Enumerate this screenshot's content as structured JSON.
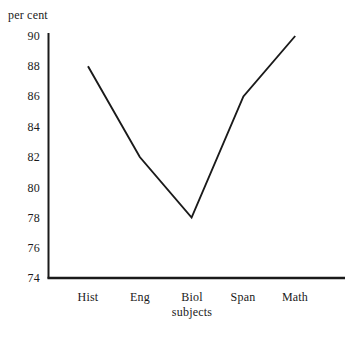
{
  "chart_data": {
    "type": "line",
    "title": "",
    "xlabel": "subjects",
    "ylabel": "per cent",
    "categories": [
      "Hist",
      "Eng",
      "Biol",
      "Span",
      "Math"
    ],
    "values": [
      88,
      82,
      78,
      86,
      90
    ],
    "series": [
      {
        "name": "per cent",
        "values": [
          88,
          82,
          78,
          86,
          90
        ]
      }
    ],
    "ylim": [
      74,
      90
    ],
    "yticks": [
      74,
      76,
      78,
      80,
      82,
      84,
      86,
      88,
      90
    ],
    "ytick_labels": [
      "74",
      "76",
      "78",
      "80",
      "82",
      "84",
      "86",
      "88",
      "90"
    ],
    "grid": false,
    "legend": false,
    "legend_position": "none",
    "line_color": "#1a1a1a",
    "axis_color": "#1a1a1a",
    "background_color": "#ffffff",
    "markers": false,
    "annotations": []
  },
  "axis": {
    "y_title": "per cent",
    "x_title": "subjects"
  }
}
